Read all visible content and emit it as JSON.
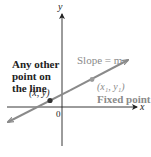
{
  "diagram": {
    "type": "coordinate-plane-line",
    "axes": {
      "x_label": "x",
      "y_label": "y",
      "origin_label": "0"
    },
    "line": {
      "slope_label": "Slope = m",
      "color": "#8a8a8a"
    },
    "points": [
      {
        "name": "other-point",
        "coord_label": "(x, y)",
        "description_lines": [
          "Any other",
          "point on",
          "the line"
        ],
        "color": "#333333"
      },
      {
        "name": "fixed-point",
        "coord_label": "(x₁, y₁)",
        "description": "Fixed point",
        "color": "#9a9a9a"
      }
    ]
  }
}
